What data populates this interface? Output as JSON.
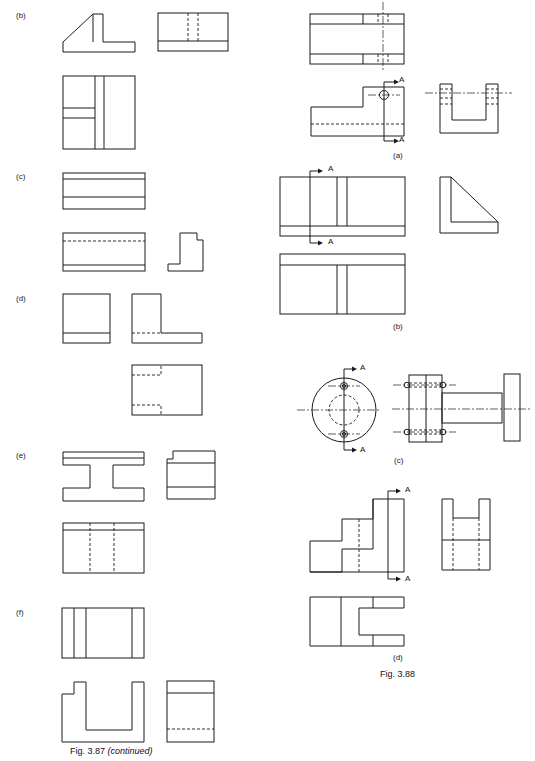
{
  "figure_387": {
    "caption": "Fig. 3.87",
    "caption_suffix": "(continued)",
    "parts": [
      {
        "label": "(b)"
      },
      {
        "label": "(c)"
      },
      {
        "label": "(d)"
      },
      {
        "label": "(e)"
      },
      {
        "label": "(f)"
      }
    ]
  },
  "figure_388": {
    "caption": "Fig. 3.88",
    "parts": [
      {
        "label": "(a)",
        "section_marks": [
          "A",
          "A"
        ]
      },
      {
        "label": "(b)",
        "section_marks": [
          "A",
          "A"
        ]
      },
      {
        "label": "(c)",
        "section_marks": [
          "A",
          "A"
        ]
      },
      {
        "label": "(d)",
        "section_marks": [
          "A",
          "A"
        ]
      }
    ]
  }
}
